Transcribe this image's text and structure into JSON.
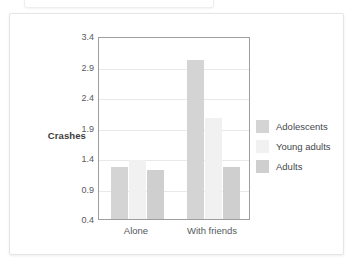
{
  "card": {
    "background": "#ffffff",
    "border_color": "#e3e6e8"
  },
  "chart_data": {
    "type": "bar",
    "title": "",
    "xlabel": "",
    "ylabel": "Crashes",
    "categories": [
      "Alone",
      "With friends"
    ],
    "series": [
      {
        "name": "Adolescents",
        "values": [
          1.25,
          3.0
        ],
        "color": "#d4d4d4"
      },
      {
        "name": "Young adults",
        "values": [
          1.37,
          2.05
        ],
        "color": "#f1f1f1"
      },
      {
        "name": "Adults",
        "values": [
          1.2,
          1.25
        ],
        "color": "#cfcfcf"
      }
    ],
    "ylim": [
      0.4,
      3.4
    ],
    "ytick_labels": [
      "3.4",
      "2.9",
      "2.4",
      "1.9",
      "1.4",
      "0.9",
      "0.4"
    ],
    "ytick_values": [
      3.4,
      2.9,
      2.4,
      1.9,
      1.4,
      0.9,
      0.4
    ],
    "grid": true,
    "legend_position": "right",
    "legend_entries": [
      "Adolescents",
      "Young adults",
      "Adults"
    ]
  }
}
